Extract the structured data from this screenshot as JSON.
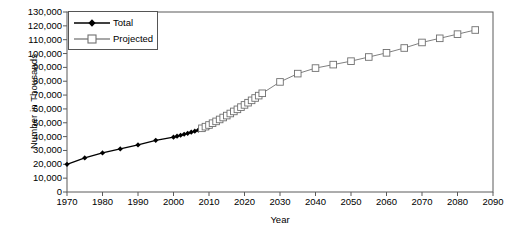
{
  "chart_data": {
    "type": "line",
    "title": "",
    "xlabel": "Year",
    "ylabel": "Number in Thousands",
    "xlim": [
      1970,
      2090
    ],
    "ylim": [
      0,
      130000
    ],
    "grid": false,
    "legend_position": "top-left",
    "xticks": [
      1970,
      1980,
      1990,
      2000,
      2010,
      2020,
      2030,
      2040,
      2050,
      2060,
      2070,
      2080,
      2090
    ],
    "xtick_labels": [
      "1970",
      "1980",
      "1990",
      "2000",
      "2010",
      "2020",
      "2030",
      "2040",
      "2050",
      "2060",
      "2070",
      "2080",
      "2090"
    ],
    "yticks": [
      0,
      10000,
      20000,
      30000,
      40000,
      50000,
      60000,
      70000,
      80000,
      90000,
      100000,
      110000,
      120000,
      130000
    ],
    "ytick_labels": [
      "0",
      "10,000",
      "20,000",
      "30,000",
      "40,000",
      "50,000",
      "60,000",
      "70,000",
      "80,000",
      "90,000",
      "100,000",
      "110,000",
      "120,000",
      "130,000"
    ],
    "series": [
      {
        "name": "Total",
        "color": "#000000",
        "marker": "filled-diamond",
        "x": [
          1970,
          1975,
          1980,
          1985,
          1990,
          1995,
          2000,
          2001,
          2002,
          2003,
          2004,
          2005,
          2006,
          2007,
          2008,
          2009,
          2010
        ],
        "values": [
          20000,
          24600,
          28200,
          31100,
          34000,
          37300,
          39600,
          40300,
          41000,
          41700,
          42400,
          43200,
          43900,
          44700,
          45400,
          46200,
          47000
        ]
      },
      {
        "name": "Projected",
        "color": "#808080",
        "marker": "open-square",
        "x": [
          2008,
          2009,
          2010,
          2011,
          2012,
          2013,
          2014,
          2015,
          2016,
          2017,
          2018,
          2019,
          2020,
          2021,
          2022,
          2023,
          2024,
          2025,
          2030,
          2035,
          2040,
          2045,
          2050,
          2055,
          2060,
          2065,
          2070,
          2075,
          2080,
          2085
        ],
        "values": [
          46000,
          47200,
          48400,
          49700,
          51000,
          52400,
          53800,
          55200,
          56700,
          58200,
          59700,
          61300,
          62900,
          64500,
          66200,
          67900,
          69600,
          71300,
          79500,
          85500,
          89500,
          92000,
          94500,
          97500,
          100500,
          104000,
          108000,
          111000,
          114000,
          117000
        ]
      }
    ]
  },
  "legend": {
    "entries": [
      {
        "label": "Total"
      },
      {
        "label": "Projected"
      }
    ]
  },
  "axes": {
    "x_title": "Year",
    "y_title": "Number in Thousands"
  }
}
